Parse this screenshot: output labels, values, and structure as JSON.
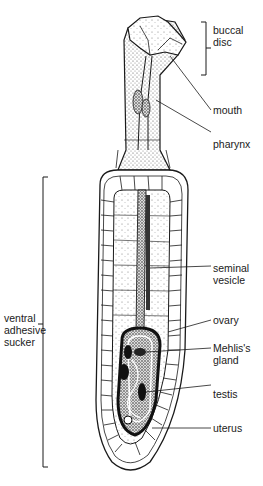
{
  "figure": {
    "labels": {
      "buccal_disc": [
        "buccal",
        "disc"
      ],
      "mouth": "mouth",
      "pharynx": "pharynx",
      "ventral_adhesive_sucker": [
        "ventral",
        "adhesive",
        "sucker"
      ],
      "seminal_vesicle": [
        "seminal",
        "vesicle"
      ],
      "ovary": "ovary",
      "mehlis_gland": [
        "Mehlis's",
        "gland"
      ],
      "testis": "testis",
      "uterus": "uterus"
    },
    "colors": {
      "ink": "#1a1a1a",
      "stipple": "#6a6a6a",
      "background": "#ffffff"
    }
  }
}
